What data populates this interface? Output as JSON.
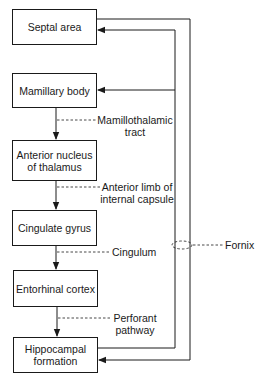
{
  "diagram": {
    "nodes": [
      {
        "id": "septal",
        "label": "Septal area"
      },
      {
        "id": "mamillary",
        "label": "Mamillary body"
      },
      {
        "id": "anterior",
        "label_line1": "Anterior nucleus",
        "label_line2": "of thalamus"
      },
      {
        "id": "cingulate",
        "label": "Cingulate gyrus"
      },
      {
        "id": "entorhinal",
        "label": "Entorhinal cortex"
      },
      {
        "id": "hippocampal",
        "label_line1": "Hippocampal",
        "label_line2": "formation"
      }
    ],
    "pathways": [
      {
        "from": "mamillary",
        "to": "anterior",
        "label_line1": "Mamillothalamic",
        "label_line2": "tract"
      },
      {
        "from": "anterior",
        "to": "cingulate",
        "label_line1": "Anterior limb of",
        "label_line2": "internal capsule"
      },
      {
        "from": "cingulate",
        "to": "entorhinal",
        "label": "Cingulum"
      },
      {
        "from": "entorhinal",
        "to": "hippocampal",
        "label_line1": "Perforant",
        "label_line2": "pathway"
      },
      {
        "from": "hippocampal",
        "to": "septal",
        "via": "Fornix"
      },
      {
        "from": "hippocampal",
        "to": "mamillary",
        "via": "Fornix"
      },
      {
        "from": "septal",
        "to": "hippocampal",
        "via": "Fornix"
      }
    ],
    "fornix_label": "Fornix"
  }
}
